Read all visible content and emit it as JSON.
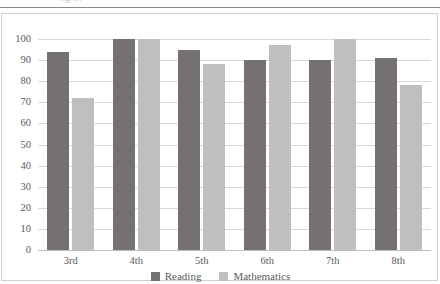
{
  "top_remnant_text": "ng  ...",
  "chart_data": {
    "type": "bar",
    "title": "",
    "xlabel": "",
    "ylabel": "",
    "categories": [
      "3rd",
      "4th",
      "5th",
      "6th",
      "7th",
      "8th"
    ],
    "series": [
      {
        "name": "Reading",
        "color": "#767171",
        "values": [
          94,
          100,
          95,
          90,
          90,
          91
        ]
      },
      {
        "name": "Mathematics",
        "color": "#bfbfbf",
        "values": [
          72,
          100,
          88,
          97,
          100,
          78
        ]
      }
    ],
    "ylim": [
      0,
      100
    ],
    "ytick_step": 10,
    "yticks": [
      "100",
      "90",
      "80",
      "70",
      "60",
      "50",
      "40",
      "30",
      "20",
      "10",
      "0"
    ],
    "grid": true,
    "legend_position": "bottom-center"
  },
  "legend": {
    "items": [
      {
        "label": "Reading"
      },
      {
        "label": "Mathematics"
      }
    ]
  },
  "colors": {
    "reading": "#767171",
    "mathematics": "#bfbfbf",
    "gridline": "#d9d9d9",
    "axis_text": "#595959",
    "frame_border": "#d0d0d0"
  }
}
